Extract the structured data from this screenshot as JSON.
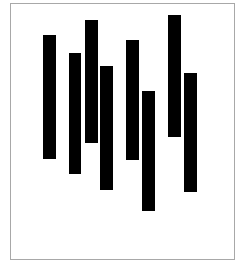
{
  "figure": {
    "title": "",
    "background_color": "#ffffff",
    "frame": {
      "border_color": "#a8a8a8",
      "border_width_px": 1,
      "left_px": 10,
      "top_px": 3,
      "width_px": 225,
      "height_px": 257
    }
  },
  "chart_data": {
    "type": "bar",
    "variant": "floating-range-bar",
    "title": "",
    "subtitle": "",
    "xlabel": "",
    "ylabel": "",
    "grid": false,
    "legend": null,
    "legend_position": "none",
    "bar_color": "#000000",
    "categories": [
      "1",
      "2",
      "3",
      "4",
      "5",
      "6",
      "7",
      "8"
    ],
    "xlim": [
      0,
      225
    ],
    "ylim": [
      0,
      257
    ],
    "y_axis_direction": "top-down-pixels",
    "tick_labels_x": [],
    "tick_labels_y": [],
    "annotations": [],
    "bars": [
      {
        "category": "1",
        "x_px": 32,
        "width_px": 13,
        "top_px": 31,
        "bottom_px": 155,
        "height_px": 124
      },
      {
        "category": "2",
        "x_px": 58,
        "width_px": 12,
        "top_px": 49,
        "bottom_px": 170,
        "height_px": 121
      },
      {
        "category": "3",
        "x_px": 74,
        "width_px": 13,
        "top_px": 16,
        "bottom_px": 139,
        "height_px": 123
      },
      {
        "category": "4",
        "x_px": 89,
        "width_px": 13,
        "top_px": 62,
        "bottom_px": 186,
        "height_px": 124
      },
      {
        "category": "5",
        "x_px": 115,
        "width_px": 13,
        "top_px": 36,
        "bottom_px": 156,
        "height_px": 120
      },
      {
        "category": "6",
        "x_px": 131,
        "width_px": 13,
        "top_px": 87,
        "bottom_px": 207,
        "height_px": 120
      },
      {
        "category": "7",
        "x_px": 157,
        "width_px": 13,
        "top_px": 11,
        "bottom_px": 133,
        "height_px": 122
      },
      {
        "category": "8",
        "x_px": 173,
        "width_px": 13,
        "top_px": 69,
        "bottom_px": 188,
        "height_px": 119
      }
    ],
    "values": [
      124,
      121,
      123,
      124,
      120,
      120,
      122,
      119
    ],
    "starts": [
      31,
      49,
      16,
      62,
      36,
      87,
      11,
      69
    ],
    "ends": [
      155,
      170,
      139,
      186,
      156,
      207,
      133,
      188
    ]
  }
}
